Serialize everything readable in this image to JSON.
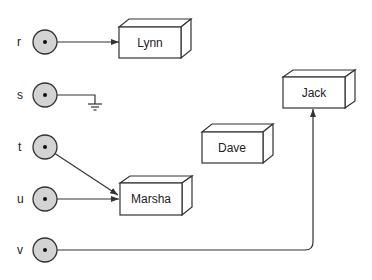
{
  "nodes": [
    {
      "id": "r",
      "label": "r",
      "cy": 42
    },
    {
      "id": "s",
      "label": "s",
      "cy": 95
    },
    {
      "id": "t",
      "label": "t",
      "cy": 147
    },
    {
      "id": "u",
      "label": "u",
      "cy": 199
    },
    {
      "id": "v",
      "label": "v",
      "cy": 250
    }
  ],
  "boxes": [
    {
      "id": "lynn",
      "label": "Lynn"
    },
    {
      "id": "jack",
      "label": "Jack"
    },
    {
      "id": "dave",
      "label": "Dave"
    },
    {
      "id": "marsha",
      "label": "Marsha"
    }
  ],
  "connections": [
    {
      "from": "r",
      "to": "Lynn"
    },
    {
      "from": "s",
      "to": "ground"
    },
    {
      "from": "t",
      "to": "Marsha"
    },
    {
      "from": "u",
      "to": "Marsha"
    },
    {
      "from": "v",
      "to": "Jack"
    }
  ],
  "colors": {
    "node_fill": "#d3d3d3",
    "stroke": "#333333"
  }
}
